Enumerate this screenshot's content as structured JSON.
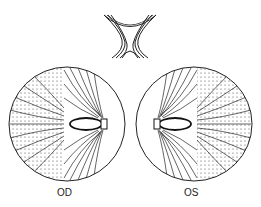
{
  "diagram": {
    "chiasm": {
      "label": ""
    },
    "eyes": [
      {
        "id": "right-eye",
        "label": "OD"
      },
      {
        "id": "left-eye",
        "label": "OS"
      }
    ],
    "colors": {
      "line": "#111111",
      "background": "#ffffff",
      "stipple": "#222222"
    }
  }
}
